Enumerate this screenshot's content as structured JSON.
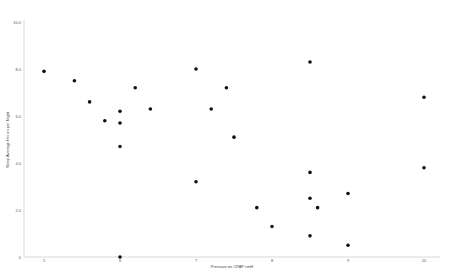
{
  "chart_data": {
    "type": "scatter",
    "title": "",
    "xlabel": "Pressure on CPAP cmH",
    "ylabel": "Sleep Average Hrs on per Night",
    "xlim": [
      5,
      10
    ],
    "ylim": [
      0,
      10
    ],
    "x_ticks": [
      "5",
      "6",
      "7",
      "8",
      "9",
      "10"
    ],
    "y_ticks": [
      "0",
      "2.0",
      "4.0",
      "6.0",
      "8.0",
      "10.0"
    ],
    "grid": false,
    "legend": null,
    "series": [
      {
        "name": "Observations",
        "color": "#111111",
        "points": [
          {
            "x": 5.0,
            "y": 7.9
          },
          {
            "x": 5.4,
            "y": 7.5
          },
          {
            "x": 5.6,
            "y": 6.6
          },
          {
            "x": 5.8,
            "y": 5.8
          },
          {
            "x": 6.0,
            "y": 6.2
          },
          {
            "x": 6.0,
            "y": 5.7
          },
          {
            "x": 6.0,
            "y": 4.7
          },
          {
            "x": 6.0,
            "y": 0.0
          },
          {
            "x": 6.2,
            "y": 7.2
          },
          {
            "x": 6.4,
            "y": 6.3
          },
          {
            "x": 7.0,
            "y": 8.0
          },
          {
            "x": 7.2,
            "y": 6.3
          },
          {
            "x": 7.4,
            "y": 7.2
          },
          {
            "x": 7.5,
            "y": 5.1
          },
          {
            "x": 7.0,
            "y": 3.2
          },
          {
            "x": 7.8,
            "y": 2.1
          },
          {
            "x": 8.0,
            "y": 1.3
          },
          {
            "x": 8.5,
            "y": 8.3
          },
          {
            "x": 8.5,
            "y": 3.6
          },
          {
            "x": 8.5,
            "y": 2.5
          },
          {
            "x": 8.6,
            "y": 2.1
          },
          {
            "x": 8.5,
            "y": 0.9
          },
          {
            "x": 9.0,
            "y": 2.7
          },
          {
            "x": 9.0,
            "y": 0.5
          },
          {
            "x": 10.0,
            "y": 6.8
          },
          {
            "x": 10.0,
            "y": 3.8
          }
        ]
      }
    ]
  }
}
